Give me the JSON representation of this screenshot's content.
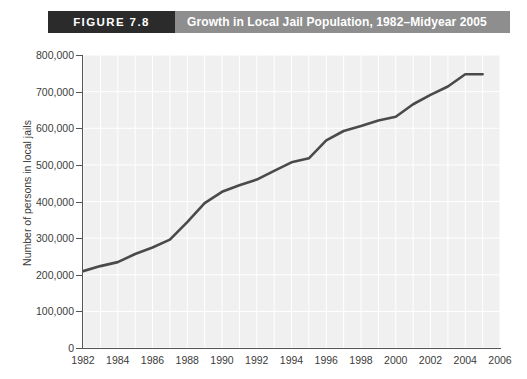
{
  "figure": {
    "number_label": "FIGURE 7.8",
    "title": "Growth in Local Jail Population, 1982–Midyear 2005"
  },
  "colors": {
    "figure_number_bg": "#2b2b2b",
    "figure_title_bg": "#8e8e8e",
    "plot_bg": "#f0f0f0",
    "gridline": "#ffffff",
    "axis": "#555555",
    "line": "#4a4a4a",
    "text": "#3b3b3b"
  },
  "chart_data": {
    "type": "line",
    "title": "Growth in Local Jail Population, 1982–Midyear 2005",
    "xlabel": "",
    "ylabel": "Number of persons in local jails",
    "xlim": [
      1982,
      2006
    ],
    "ylim": [
      0,
      800000
    ],
    "grid": true,
    "legend": "none",
    "x_ticks": [
      1982,
      1984,
      1986,
      1988,
      1990,
      1992,
      1994,
      1996,
      1998,
      2000,
      2002,
      2004,
      2006
    ],
    "x_tick_labels": [
      "1982",
      "1984",
      "1986",
      "1988",
      "1990",
      "1992",
      "1994",
      "1996",
      "1998",
      "2000",
      "2002",
      "2004",
      "2006"
    ],
    "y_ticks": [
      0,
      100000,
      200000,
      300000,
      400000,
      500000,
      600000,
      700000,
      800000
    ],
    "y_tick_labels": [
      "0",
      "100,000",
      "200,000",
      "300,000",
      "400,000",
      "500,000",
      "600,000",
      "700,000",
      "800,000"
    ],
    "x": [
      1982,
      1983,
      1984,
      1985,
      1986,
      1987,
      1988,
      1989,
      1990,
      1991,
      1992,
      1993,
      1994,
      1995,
      1996,
      1997,
      1998,
      1999,
      2000,
      2001,
      2002,
      2003,
      2004,
      2005
    ],
    "values": [
      209600,
      223550,
      234500,
      256600,
      274400,
      295900,
      343600,
      395550,
      426500,
      444600,
      459800,
      483700,
      507000,
      518000,
      567100,
      592500,
      605900,
      621100,
      631200,
      665500,
      691300,
      713990,
      747500,
      747500
    ],
    "series": [
      {
        "name": "Local jail population",
        "values": [
          209600,
          223550,
          234500,
          256600,
          274400,
          295900,
          343600,
          395550,
          426500,
          444600,
          459800,
          483700,
          507000,
          518000,
          567100,
          592500,
          605900,
          621100,
          631200,
          665500,
          691300,
          713990,
          747500,
          747500
        ]
      }
    ]
  }
}
